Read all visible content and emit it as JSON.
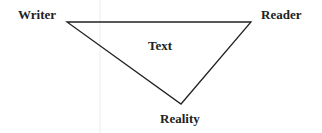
{
  "diagram": {
    "type": "triangle",
    "nodes": {
      "top_left": "Writer",
      "top_right": "Reader",
      "bottom": "Reality",
      "center": "Text"
    },
    "edges": [
      [
        "Writer",
        "Reader"
      ],
      [
        "Writer",
        "Reality"
      ],
      [
        "Reader",
        "Reality"
      ]
    ],
    "colors": {
      "line": "#222222",
      "text": "#222222",
      "guide": "#e6e6e6",
      "background": "#ffffff"
    }
  }
}
